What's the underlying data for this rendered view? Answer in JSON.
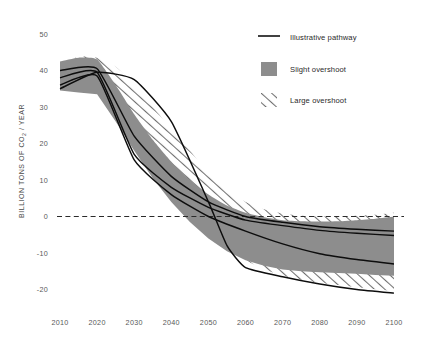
{
  "chart_data": {
    "type": "area",
    "title": "",
    "xlabel": "",
    "ylabel": "BILLION TONS OF CO",
    "ylabel_sub": "2",
    "ylabel_tail": " / YEAR",
    "xlim": [
      2010,
      2100
    ],
    "ylim": [
      -25,
      52
    ],
    "grid": false,
    "zero_line": 0,
    "x": [
      2010,
      2020,
      2030,
      2040,
      2050,
      2060,
      2070,
      2080,
      2090,
      2100
    ],
    "xtick_labels": [
      "2010",
      "2020",
      "2030",
      "2040",
      "2050",
      "2060",
      "2070",
      "2080",
      "2090",
      "2100"
    ],
    "ytick_values": [
      50,
      40,
      30,
      20,
      10,
      0,
      -10,
      -20
    ],
    "ytick_labels": [
      "50",
      "40",
      "30",
      "20",
      "10",
      "0",
      "-10",
      "-20"
    ],
    "bands": [
      {
        "name": "Slight overshoot",
        "style": "solid-gray",
        "color": "#8d8d8d",
        "x": [
          2010,
          2015,
          2020,
          2025,
          2030,
          2035,
          2040,
          2045,
          2050,
          2055,
          2060,
          2065,
          2070,
          2075,
          2080,
          2085,
          2090,
          2095,
          2100
        ],
        "upper": [
          42.5,
          43.5,
          43.0,
          36.0,
          28.0,
          21.0,
          15.0,
          10.0,
          6.0,
          3.0,
          1.0,
          -0.2,
          -1.0,
          -1.3,
          -1.4,
          -1.3,
          -1.0,
          -0.6,
          0.0
        ],
        "lower": [
          34.5,
          34.0,
          33.5,
          26.0,
          18.0,
          10.5,
          4.0,
          -1.5,
          -6.0,
          -9.5,
          -12.0,
          -13.5,
          -14.5,
          -15.0,
          -15.3,
          -15.5,
          -15.7,
          -16.0,
          -16.2
        ]
      },
      {
        "name": "Large overshoot",
        "style": "hatched",
        "color": "#6f6f6f",
        "x": [
          2010,
          2015,
          2020,
          2025,
          2030,
          2035,
          2040,
          2045,
          2050,
          2055,
          2060,
          2065,
          2070,
          2075,
          2080,
          2085,
          2090,
          2095,
          2100
        ],
        "upper": [
          42.0,
          43.8,
          43.5,
          41.0,
          36.0,
          30.0,
          24.0,
          18.0,
          12.0,
          7.5,
          4.0,
          2.0,
          0.8,
          0.2,
          0.0,
          0.0,
          0.2,
          0.5,
          1.0
        ],
        "lower": [
          35.0,
          34.5,
          34.0,
          27.5,
          20.5,
          13.5,
          7.0,
          1.0,
          -4.0,
          -8.5,
          -12.0,
          -14.5,
          -16.2,
          -17.3,
          -18.2,
          -18.8,
          -19.4,
          -19.9,
          -20.4
        ]
      }
    ],
    "pathways": [
      {
        "name": "pathway-a",
        "x": [
          2010,
          2020,
          2030,
          2040,
          2050,
          2060,
          2070,
          2080,
          2090,
          2100
        ],
        "values": [
          40.0,
          40.5,
          22.0,
          11.0,
          4.0,
          0.0,
          -1.6,
          -2.8,
          -3.5,
          -4.0
        ]
      },
      {
        "name": "pathway-b",
        "x": [
          2010,
          2020,
          2030,
          2040,
          2050,
          2060,
          2070,
          2080,
          2090,
          2100
        ],
        "values": [
          38.0,
          39.5,
          17.0,
          8.0,
          2.5,
          -1.0,
          -2.5,
          -3.8,
          -4.6,
          -5.2
        ]
      },
      {
        "name": "pathway-c",
        "x": [
          2010,
          2020,
          2030,
          2040,
          2050,
          2060,
          2070,
          2080,
          2090,
          2100
        ],
        "values": [
          36.0,
          38.5,
          15.5,
          6.0,
          0.0,
          -4.0,
          -7.5,
          -10.2,
          -11.8,
          -13.0
        ]
      },
      {
        "name": "pathway-d",
        "x": [
          2010,
          2020,
          2030,
          2040,
          2050,
          2055,
          2060,
          2070,
          2080,
          2090,
          2100
        ],
        "values": [
          35.0,
          39.5,
          37.5,
          26.0,
          4.0,
          -8.0,
          -14.0,
          -16.5,
          -18.5,
          -20.0,
          -21.0
        ]
      }
    ],
    "legend": {
      "position": "top-right",
      "entries": [
        {
          "label": "Illustrative pathway",
          "marker": "line",
          "color": "#111111"
        },
        {
          "label": "Slight overshoot",
          "marker": "swatch",
          "color": "#8d8d8d"
        },
        {
          "label": "Large overshoot",
          "marker": "hatched",
          "color": "#6f6f6f"
        }
      ]
    }
  }
}
